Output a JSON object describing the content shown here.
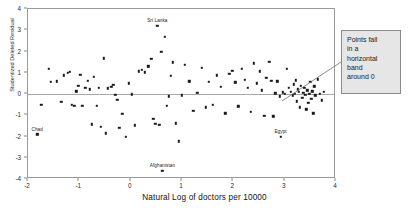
{
  "chart_data": {
    "type": "scatter",
    "title": "",
    "xlabel": "Natural Log of doctors per 10000",
    "ylabel": "Studentized Deleted Residual",
    "xlim": [
      -2,
      4
    ],
    "ylim": [
      -4,
      4
    ],
    "xticks": [
      "-2",
      "-1",
      "0",
      "1",
      "2",
      "3",
      "4"
    ],
    "xtick_values": [
      -2,
      -1,
      0,
      1,
      2,
      3,
      4
    ],
    "yticks": [
      "4",
      "3",
      "2",
      "1",
      "0",
      "-1",
      "-2",
      "-3",
      "-4"
    ],
    "ytick_values": [
      4,
      3,
      2,
      1,
      0,
      -1,
      -2,
      -3,
      -4
    ],
    "grid": false,
    "legend": false,
    "reference_lines": [
      {
        "axis": "y",
        "value": 0
      }
    ],
    "marker": "dot",
    "marker_color": "#1a1a1a",
    "points": [
      [
        -1.82,
        -1.9
      ],
      [
        -1.74,
        -0.52
      ],
      [
        -1.6,
        1.18
      ],
      [
        -1.55,
        0.58
      ],
      [
        -1.44,
        0.6
      ],
      [
        -1.35,
        -0.36
      ],
      [
        -1.3,
        0.88
      ],
      [
        -1.22,
        1.0
      ],
      [
        -1.18,
        1.05
      ],
      [
        -1.15,
        -0.52
      ],
      [
        -1.1,
        -0.55
      ],
      [
        -1.06,
        0.12
      ],
      [
        -1.02,
        0.4
      ],
      [
        -0.98,
        0.9
      ],
      [
        -0.94,
        -0.56
      ],
      [
        -0.88,
        0.3
      ],
      [
        -0.84,
        0.62
      ],
      [
        -0.8,
        0.22
      ],
      [
        -0.76,
        -1.42
      ],
      [
        -0.72,
        0.8
      ],
      [
        -0.66,
        -0.55
      ],
      [
        -0.62,
        0.3
      ],
      [
        -0.58,
        -1.55
      ],
      [
        -0.52,
        1.68
      ],
      [
        -0.48,
        -1.85
      ],
      [
        -0.44,
        0.26
      ],
      [
        -0.38,
        0.35
      ],
      [
        -0.34,
        0.42
      ],
      [
        -0.3,
        -0.04
      ],
      [
        -0.26,
        -0.28
      ],
      [
        -0.22,
        -1.58
      ],
      [
        -0.16,
        -0.92
      ],
      [
        -0.1,
        -2.02
      ],
      [
        -0.04,
        0.5
      ],
      [
        0.02,
        -0.02
      ],
      [
        0.08,
        -1.48
      ],
      [
        0.16,
        1.06
      ],
      [
        0.22,
        1.15
      ],
      [
        0.28,
        1.02
      ],
      [
        0.34,
        1.3
      ],
      [
        0.4,
        1.65
      ],
      [
        0.44,
        -1.18
      ],
      [
        0.48,
        -1.4
      ],
      [
        0.52,
        3.22
      ],
      [
        0.56,
        -1.44
      ],
      [
        0.6,
        2.0
      ],
      [
        0.62,
        -3.62
      ],
      [
        0.66,
        2.68
      ],
      [
        0.7,
        -0.56
      ],
      [
        0.74,
        -0.1
      ],
      [
        0.78,
        0.85
      ],
      [
        0.82,
        1.5
      ],
      [
        0.88,
        -1.38
      ],
      [
        0.94,
        -2.22
      ],
      [
        1.0,
        -0.06
      ],
      [
        1.06,
        1.38
      ],
      [
        1.14,
        0.6
      ],
      [
        1.22,
        -0.78
      ],
      [
        1.3,
        0.05
      ],
      [
        1.38,
        1.22
      ],
      [
        1.46,
        -0.62
      ],
      [
        1.52,
        0.58
      ],
      [
        1.6,
        -0.52
      ],
      [
        1.68,
        0.88
      ],
      [
        1.76,
        0.34
      ],
      [
        1.84,
        -0.9
      ],
      [
        1.92,
        0.96
      ],
      [
        1.98,
        1.08
      ],
      [
        2.04,
        0.55
      ],
      [
        2.1,
        -0.58
      ],
      [
        2.16,
        1.18
      ],
      [
        2.22,
        0.66
      ],
      [
        2.28,
        0.3
      ],
      [
        2.34,
        -0.85
      ],
      [
        2.4,
        1.44
      ],
      [
        2.46,
        0.5
      ],
      [
        2.52,
        1.06
      ],
      [
        2.56,
        0.18
      ],
      [
        2.6,
        -1.02
      ],
      [
        2.64,
        0.76
      ],
      [
        2.7,
        1.52
      ],
      [
        2.74,
        0.62
      ],
      [
        2.78,
        -1.05
      ],
      [
        2.82,
        0.04
      ],
      [
        2.86,
        0.6
      ],
      [
        2.9,
        -0.1
      ],
      [
        2.92,
        -2.02
      ],
      [
        2.96,
        0.08
      ],
      [
        3.0,
        0.02
      ],
      [
        3.04,
        1.2
      ],
      [
        3.08,
        0.3
      ],
      [
        3.12,
        0.1
      ],
      [
        3.16,
        -0.06
      ],
      [
        3.18,
        0.46
      ],
      [
        3.2,
        0.02
      ],
      [
        3.22,
        0.64
      ],
      [
        3.24,
        -0.34
      ],
      [
        3.26,
        0.22
      ],
      [
        3.28,
        0.1
      ],
      [
        3.3,
        -0.62
      ],
      [
        3.32,
        0.4
      ],
      [
        3.34,
        -0.18
      ],
      [
        3.36,
        0.06
      ],
      [
        3.38,
        0.3
      ],
      [
        3.4,
        -0.05
      ],
      [
        3.42,
        -0.72
      ],
      [
        3.44,
        0.18
      ],
      [
        3.46,
        -0.4
      ],
      [
        3.48,
        0.02
      ],
      [
        3.5,
        0.58
      ],
      [
        3.52,
        -0.22
      ],
      [
        3.54,
        0.12
      ],
      [
        3.56,
        -0.9
      ],
      [
        3.58,
        0.36
      ],
      [
        3.6,
        -0.06
      ],
      [
        3.64,
        0.7
      ],
      [
        3.68,
        0.02
      ],
      [
        3.72,
        -0.3
      ],
      [
        3.76,
        0.1
      ]
    ],
    "labeled_points": [
      {
        "label": "Sri Lanka",
        "x": 0.52,
        "y": 3.22
      },
      {
        "label": "Chad",
        "x": -1.82,
        "y": -1.9
      },
      {
        "label": "Afghanistan",
        "x": 0.62,
        "y": -3.62
      },
      {
        "label": "Egypt",
        "x": 2.92,
        "y": -2.02
      }
    ],
    "annotations": [
      {
        "id": "band-callout",
        "lines": [
          "Points fall",
          "in a",
          "horizontal",
          "band",
          "around 0"
        ],
        "text": "Points fall in a horizontal band around 0",
        "background": "#e6e6e6",
        "border_color": "#8c8c8c",
        "leader_from": [
          341,
          62
        ],
        "leader_to": [
          282,
          101
        ]
      }
    ]
  }
}
